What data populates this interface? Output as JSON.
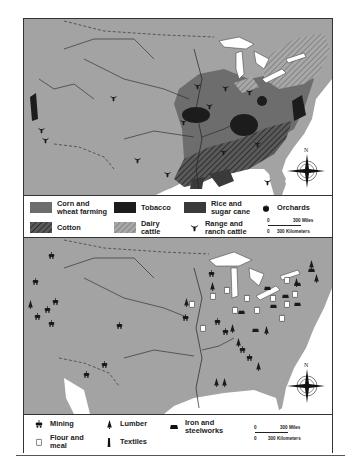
{
  "map_top": {
    "title": "Agriculture",
    "legend": [
      {
        "label": "Corn and wheat farming",
        "line1": "Corn and",
        "line2": "wheat farming",
        "swatch": "corn-wheat",
        "color": "#6d6d6d"
      },
      {
        "label": "Tobacco",
        "line1": "Tobacco",
        "swatch": "tobacco",
        "color": "#1c1c1c"
      },
      {
        "label": "Rice and sugar cane",
        "line1": "Rice and",
        "line2": "sugar cane",
        "swatch": "rice-sugar",
        "color": "#3a3a3a"
      },
      {
        "label": "Orchards",
        "line1": "Orchards",
        "icon": "apple-icon"
      },
      {
        "label": "Cotton",
        "line1": "Cotton",
        "swatch": "cotton",
        "pattern": "dark-hatch"
      },
      {
        "label": "Dairy cattle",
        "line1": "Dairy",
        "line2": "cattle",
        "swatch": "dairy",
        "pattern": "light-hatch"
      },
      {
        "label": "Range and ranch cattle",
        "line1": "Range and",
        "line2": "ranch cattle",
        "icon": "cattle-head-icon"
      }
    ],
    "scale": {
      "miles_zero": "0",
      "miles_label": "300 Miles",
      "km_zero": "0",
      "km_label": "300 Kilometers"
    },
    "compass": {
      "north_label": "N"
    }
  },
  "map_bottom": {
    "title": "Industry",
    "legend": [
      {
        "label": "Mining",
        "line1": "Mining",
        "icon": "mining-cart-icon"
      },
      {
        "label": "Lumber",
        "line1": "Lumber",
        "icon": "tree-icon"
      },
      {
        "label": "Iron and steelworks",
        "line1": "Iron and",
        "line2": "steelworks",
        "icon": "furnace-icon"
      },
      {
        "label": "Flour and meal",
        "line1": "Flour and",
        "line2": "meal",
        "icon": "flour-sack-icon"
      },
      {
        "label": "Textiles",
        "line1": "Textiles",
        "icon": "spindle-icon"
      }
    ],
    "scale": {
      "miles_zero": "0",
      "miles_label": "300 Miles",
      "km_zero": "0",
      "km_label": "300 Kilometers"
    },
    "compass": {
      "north_label": "N"
    }
  },
  "colors": {
    "land": "#a3a3a3",
    "water": "#ffffff",
    "corn_wheat": "#6d6d6d",
    "tobacco": "#1c1c1c",
    "rice_sugar": "#3a3a3a",
    "border_line": "#333333"
  }
}
